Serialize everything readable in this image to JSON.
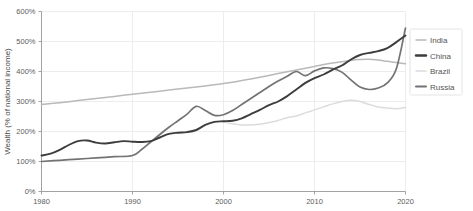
{
  "chart_data": {
    "type": "line",
    "title": "",
    "subtitle": "",
    "xlabel": "",
    "ylabel": "Wealth (% of national income)",
    "xlim": [
      1980,
      2020
    ],
    "ylim": [
      0,
      600
    ],
    "grid": true,
    "legend_position": "right",
    "x_ticks": [
      "1980",
      "1990",
      "2000",
      "2010",
      "2020"
    ],
    "x_tick_values": [
      1980,
      1990,
      2000,
      2010,
      2020
    ],
    "y_ticks": [
      "0%",
      "100%",
      "200%",
      "300%",
      "400%",
      "500%",
      "600%"
    ],
    "y_tick_values": [
      0,
      100,
      200,
      300,
      400,
      500,
      600
    ],
    "series": [
      {
        "name": "India",
        "color": "#b9b9b9",
        "width": 1.5,
        "x": [
          1980,
          1982,
          1984,
          1986,
          1988,
          1990,
          1992,
          1994,
          1996,
          1998,
          2000,
          2002,
          2004,
          2006,
          2008,
          2010,
          2012,
          2014,
          2015,
          2016,
          2017,
          2018,
          2019,
          2020
        ],
        "values": [
          290,
          296,
          303,
          310,
          317,
          324,
          331,
          338,
          345,
          352,
          360,
          370,
          381,
          393,
          405,
          417,
          428,
          437,
          440,
          441,
          438,
          434,
          430,
          426
        ]
      },
      {
        "name": "China",
        "color": "#3d3d3d",
        "width": 1.9,
        "x": [
          1980,
          1981,
          1982,
          1983,
          1984,
          1985,
          1986,
          1987,
          1988,
          1989,
          1990,
          1991,
          1992,
          1993,
          1994,
          1995,
          1996,
          1997,
          1998,
          1999,
          2000,
          2001,
          2002,
          2003,
          2004,
          2005,
          2006,
          2007,
          2008,
          2009,
          2010,
          2011,
          2012,
          2013,
          2014,
          2015,
          2016,
          2017,
          2018,
          2019,
          2020
        ],
        "values": [
          120,
          126,
          139,
          155,
          168,
          170,
          163,
          160,
          164,
          168,
          166,
          165,
          168,
          180,
          192,
          196,
          198,
          205,
          222,
          232,
          234,
          236,
          244,
          258,
          272,
          288,
          300,
          318,
          340,
          362,
          378,
          390,
          406,
          420,
          440,
          455,
          462,
          468,
          478,
          498,
          520
        ]
      },
      {
        "name": "Brazil",
        "color": "#dcdcdc",
        "width": 1.5,
        "x": [
          2000,
          2001,
          2002,
          2003,
          2004,
          2005,
          2006,
          2007,
          2008,
          2009,
          2010,
          2011,
          2012,
          2013,
          2014,
          2015,
          2016,
          2017,
          2018,
          2019,
          2020
        ],
        "values": [
          232,
          226,
          222,
          222,
          224,
          230,
          237,
          246,
          252,
          262,
          272,
          282,
          292,
          300,
          304,
          300,
          290,
          282,
          278,
          276,
          280
        ]
      },
      {
        "name": "Russia",
        "color": "#737373",
        "width": 1.7,
        "x": [
          1980,
          1982,
          1984,
          1986,
          1988,
          1990,
          1991,
          1992,
          1993,
          1994,
          1995,
          1996,
          1997,
          1998,
          1999,
          2000,
          2001,
          2002,
          2003,
          2004,
          2005,
          2006,
          2007,
          2008,
          2009,
          2010,
          2011,
          2012,
          2013,
          2014,
          2015,
          2016,
          2017,
          2018,
          2019,
          2020
        ],
        "values": [
          100,
          104,
          108,
          112,
          116,
          120,
          140,
          165,
          190,
          214,
          236,
          258,
          284,
          270,
          254,
          256,
          270,
          290,
          310,
          330,
          350,
          368,
          384,
          400,
          386,
          402,
          412,
          410,
          398,
          372,
          348,
          340,
          345,
          362,
          410,
          545
        ]
      }
    ]
  },
  "axis": {
    "y_label": "Wealth (% of national income)"
  },
  "legend": {
    "items": [
      {
        "label": "India",
        "color": "#b9b9b9"
      },
      {
        "label": "China",
        "color": "#3d3d3d"
      },
      {
        "label": "Brazil",
        "color": "#dcdcdc"
      },
      {
        "label": "Russia",
        "color": "#737373"
      }
    ]
  }
}
